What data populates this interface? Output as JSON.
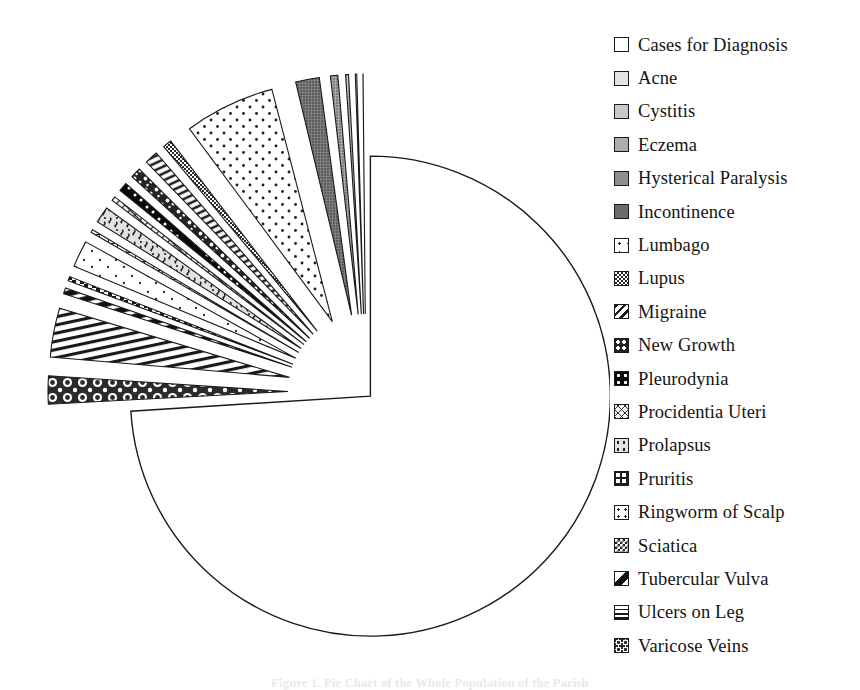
{
  "figure": {
    "caption": "Figure 1. Pie Chart of the Whole Population of the Parish"
  },
  "legend": {
    "items": [
      {
        "label": "Cases for Diagnosis",
        "swatch": "solid-white"
      },
      {
        "label": "Acne",
        "swatch": "gray-10"
      },
      {
        "label": "Cystitis",
        "swatch": "gray-25"
      },
      {
        "label": "Eczema",
        "swatch": "gray-40"
      },
      {
        "label": "Hysterical Paralysis",
        "swatch": "gray-55"
      },
      {
        "label": "Incontinence",
        "swatch": "gray-70"
      },
      {
        "label": "Lumbago",
        "swatch": "sparse-dots"
      },
      {
        "label": "Lupus",
        "swatch": "fine-checker"
      },
      {
        "label": "Migraine",
        "swatch": "diagonal-hatch"
      },
      {
        "label": "New Growth",
        "swatch": "dark-speckle"
      },
      {
        "label": "Pleurodynia",
        "swatch": "black-dots"
      },
      {
        "label": "Procidentia Uteri",
        "swatch": "crosshatch-light"
      },
      {
        "label": "Prolapsus",
        "swatch": "light-speckle"
      },
      {
        "label": "Pruritis",
        "swatch": "grid-lines"
      },
      {
        "label": "Ringworm of Scalp",
        "swatch": "tiny-dots"
      },
      {
        "label": "Sciatica",
        "swatch": "checkerboard"
      },
      {
        "label": "Tubercular Vulva",
        "swatch": "bold-diagonal"
      },
      {
        "label": "Ulcers on Leg",
        "swatch": "horizontal-lines"
      },
      {
        "label": "Varicose Veins",
        "swatch": "bubbles"
      }
    ]
  },
  "chart_data": {
    "type": "pie",
    "title": "",
    "exploded": true,
    "legend_position": "right",
    "center": {
      "x": 366,
      "y": 392
    },
    "radius": 240,
    "start_angle_deg": -90,
    "labels": [
      "Cases for Diagnosis",
      "Varicose Veins",
      "Ulcers on Leg",
      "Tubercular Vulva",
      "Sciatica",
      "Ringworm of Scalp",
      "Pruritis",
      "Prolapsus",
      "Procidentia Uteri",
      "Pleurodynia",
      "New Growth",
      "Migraine",
      "Lupus",
      "Lumbago",
      "Incontinence",
      "Hysterical Paralysis",
      "Eczema",
      "Cystitis",
      "Acne"
    ],
    "values": [
      74.0,
      2.2,
      3.6,
      0.7,
      0.6,
      2.1,
      0.5,
      1.4,
      0.6,
      0.9,
      1.0,
      1.2,
      0.9,
      6.4,
      1.9,
      0.8,
      0.5,
      0.4,
      0.3
    ],
    "units": "percent of cases",
    "slice_patterns": [
      "solid-white",
      "bubbles",
      "horizontal-lines",
      "bold-diagonal",
      "checkerboard",
      "tiny-dots",
      "grid-lines",
      "light-speckle",
      "crosshatch-light",
      "black-dots",
      "dark-speckle",
      "diagonal-hatch",
      "fine-checker",
      "sparse-dots",
      "gray-70",
      "gray-55",
      "gray-40",
      "gray-25",
      "gray-10"
    ]
  }
}
